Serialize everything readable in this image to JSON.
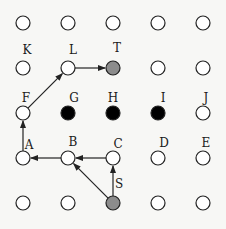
{
  "grid": {
    "cols_x": [
      23,
      68,
      113,
      158,
      203
    ],
    "rows_y": [
      23,
      68,
      113,
      158,
      203
    ],
    "radius": 7
  },
  "colors": {
    "empty_fill": "#ffffff",
    "blocked_fill": "#000000",
    "endpoint_fill": "#8c8c8c",
    "stroke": "#222222",
    "edge": "#222222"
  },
  "nodes": [
    {
      "id": "r0c0",
      "col": 0,
      "row": 0,
      "state": "empty",
      "label": ""
    },
    {
      "id": "r0c1",
      "col": 1,
      "row": 0,
      "state": "empty",
      "label": ""
    },
    {
      "id": "r0c2",
      "col": 2,
      "row": 0,
      "state": "empty",
      "label": ""
    },
    {
      "id": "r0c3",
      "col": 3,
      "row": 0,
      "state": "empty",
      "label": ""
    },
    {
      "id": "r0c4",
      "col": 4,
      "row": 0,
      "state": "empty",
      "label": ""
    },
    {
      "id": "K",
      "col": 0,
      "row": 1,
      "state": "empty",
      "label": "K"
    },
    {
      "id": "L",
      "col": 1,
      "row": 1,
      "state": "empty",
      "label": "L"
    },
    {
      "id": "T",
      "col": 2,
      "row": 1,
      "state": "endpoint",
      "label": "T"
    },
    {
      "id": "r1c3",
      "col": 3,
      "row": 1,
      "state": "empty",
      "label": ""
    },
    {
      "id": "r1c4",
      "col": 4,
      "row": 1,
      "state": "empty",
      "label": ""
    },
    {
      "id": "F",
      "col": 0,
      "row": 2,
      "state": "empty",
      "label": "F"
    },
    {
      "id": "G",
      "col": 1,
      "row": 2,
      "state": "blocked",
      "label": "G"
    },
    {
      "id": "H",
      "col": 2,
      "row": 2,
      "state": "blocked",
      "label": "H"
    },
    {
      "id": "I",
      "col": 3,
      "row": 2,
      "state": "blocked",
      "label": "I"
    },
    {
      "id": "J",
      "col": 4,
      "row": 2,
      "state": "empty",
      "label": "J"
    },
    {
      "id": "A",
      "col": 0,
      "row": 3,
      "state": "empty",
      "label": "A"
    },
    {
      "id": "B",
      "col": 1,
      "row": 3,
      "state": "empty",
      "label": "B"
    },
    {
      "id": "C",
      "col": 2,
      "row": 3,
      "state": "empty",
      "label": "C"
    },
    {
      "id": "D",
      "col": 3,
      "row": 3,
      "state": "empty",
      "label": "D"
    },
    {
      "id": "E",
      "col": 4,
      "row": 3,
      "state": "empty",
      "label": "E"
    },
    {
      "id": "r4c0",
      "col": 0,
      "row": 4,
      "state": "empty",
      "label": ""
    },
    {
      "id": "r4c1",
      "col": 1,
      "row": 4,
      "state": "empty",
      "label": ""
    },
    {
      "id": "S",
      "col": 2,
      "row": 4,
      "state": "endpoint",
      "label": "S"
    },
    {
      "id": "r4c3",
      "col": 3,
      "row": 4,
      "state": "empty",
      "label": ""
    },
    {
      "id": "r4c4",
      "col": 4,
      "row": 4,
      "state": "empty",
      "label": ""
    }
  ],
  "labels": [
    {
      "text": "K",
      "x": 27,
      "y": 54
    },
    {
      "text": "L",
      "x": 73,
      "y": 54
    },
    {
      "text": "T",
      "x": 117,
      "y": 52
    },
    {
      "text": "F",
      "x": 26,
      "y": 102
    },
    {
      "text": "G",
      "x": 74,
      "y": 102
    },
    {
      "text": "H",
      "x": 113,
      "y": 102
    },
    {
      "text": "I",
      "x": 163,
      "y": 102
    },
    {
      "text": "J",
      "x": 206,
      "y": 102
    },
    {
      "text": "A",
      "x": 29,
      "y": 149
    },
    {
      "text": "B",
      "x": 73,
      "y": 146
    },
    {
      "text": "C",
      "x": 118,
      "y": 148
    },
    {
      "text": "D",
      "x": 164,
      "y": 147
    },
    {
      "text": "E",
      "x": 206,
      "y": 147
    },
    {
      "text": "S",
      "x": 119,
      "y": 188
    }
  ],
  "edges": [
    {
      "from": "S",
      "to": "C"
    },
    {
      "from": "S",
      "to": "B"
    },
    {
      "from": "C",
      "to": "B"
    },
    {
      "from": "B",
      "to": "A"
    },
    {
      "from": "A",
      "to": "F"
    },
    {
      "from": "F",
      "to": "L"
    },
    {
      "from": "L",
      "to": "T"
    }
  ]
}
